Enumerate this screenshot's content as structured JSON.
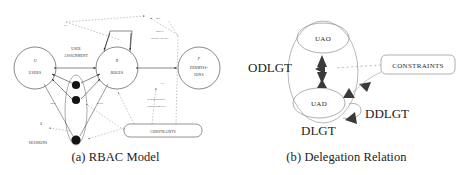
{
  "figure": {
    "panels": [
      {
        "id": "rbac-model",
        "caption": "(a) RBAC Model",
        "nodes": [
          {
            "id": "users",
            "symbol": "U",
            "label": "USERS",
            "shape": "circle"
          },
          {
            "id": "roles",
            "symbol": "R",
            "label": "ROLES",
            "shape": "circle"
          },
          {
            "id": "permissions",
            "symbol": "P",
            "label_line1": "PERMISS-",
            "label_line2": "IONS",
            "shape": "circle"
          },
          {
            "id": "sessions",
            "symbol": "S",
            "label": "SESSIONS",
            "shape": "node"
          },
          {
            "id": "constraints",
            "label": "CONSTRAINTS",
            "shape": "rounded-box"
          }
        ],
        "edge_labels": [
          {
            "id": "ua",
            "text": "UA"
          },
          {
            "id": "rh",
            "text": "RH"
          },
          {
            "id": "pa",
            "text": "PA"
          },
          {
            "id": "user-assignment-1",
            "text": "USER"
          },
          {
            "id": "user-assignment-2",
            "text": "ASSIGNMENT"
          },
          {
            "id": "role-hierarchy-1",
            "text": "ROLE"
          },
          {
            "id": "role-hierarchy-2",
            "text": "HIERARCHY"
          },
          {
            "id": "permission-assignment-1",
            "text": "PERMISSION"
          },
          {
            "id": "permission-assignment-2",
            "text": "ASSIGNMENT"
          },
          {
            "id": "user-sessions",
            "text": "user"
          },
          {
            "id": "role-sessions",
            "text": "roles"
          }
        ]
      },
      {
        "id": "delegation-relation",
        "caption": "(b) Delegation Relation",
        "nodes": [
          {
            "id": "uao",
            "label": "UAO",
            "shape": "ellipse"
          },
          {
            "id": "uad",
            "label": "UAD",
            "shape": "ellipse"
          },
          {
            "id": "constraints",
            "label": "CONSTRAINTS",
            "shape": "rounded-box"
          }
        ],
        "group_labels": [
          {
            "id": "odlgt",
            "text": "ODLGT"
          },
          {
            "id": "dlgt",
            "text": "DLGT"
          },
          {
            "id": "ddlgt",
            "text": "DDLGT"
          }
        ]
      }
    ]
  },
  "colors": {
    "stroke": "#3a3a3a",
    "stroke_light": "#8a8a8a",
    "fill_node": "#1a1a1a",
    "background": "#ffffff",
    "text": "#2a2a2a"
  }
}
